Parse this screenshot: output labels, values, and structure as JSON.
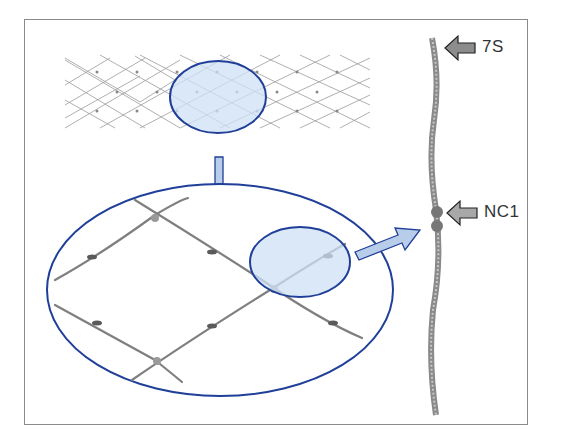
{
  "figure": {
    "labels": {
      "top_marker": "7S",
      "mid_marker": "NC1"
    },
    "colors": {
      "highlight_fill": "#cfe0f5",
      "highlight_stroke": "#1f3f99",
      "arrow_fill": "#b8cdea",
      "marker_arrow_fill": "#8c8c8c",
      "fiber": "#8a8a8a",
      "frame": "#8a8a8a"
    },
    "icons": [
      "zoom-down-arrow-icon",
      "zoom-right-arrow-icon",
      "pointer-arrow-icon"
    ]
  }
}
